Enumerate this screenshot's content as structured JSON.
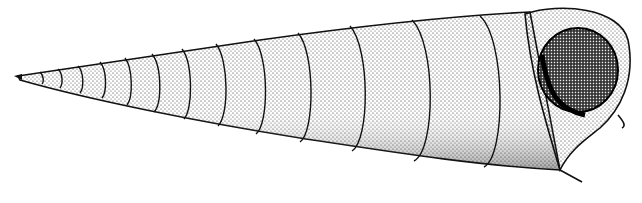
{
  "image": {
    "subject": "turritella shell stipple illustration",
    "background": "#ffffff",
    "ink": "#111111",
    "whorl_count": 12
  }
}
